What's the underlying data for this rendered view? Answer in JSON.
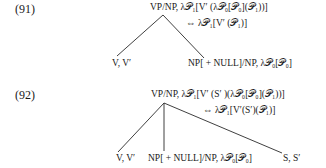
{
  "examples": [
    {
      "number": "(91)",
      "root": "VP/NP, λ𝒫₁[V′ (λ𝒫₀[𝒫₀](𝒫₁))]",
      "equiv": "⇔ λ𝒫₁[V′ (𝒫₁)]",
      "children": [
        "V, V′",
        "NP[ + NULL]/NP, λ𝒫₀[𝒫₀]"
      ]
    },
    {
      "number": "(92)",
      "root": "VP/NP, λ𝒫₁[V′ (S′ )(λ𝒫₀[𝒫₀](𝒫₁))]",
      "equiv": "⇔ λ𝒫₁[V′(S′)(𝒫₁)]",
      "children": [
        "V, V′",
        "NP[ + NULL]/NP, λ𝒫₀[𝒫₀]",
        "S, S′"
      ]
    }
  ]
}
